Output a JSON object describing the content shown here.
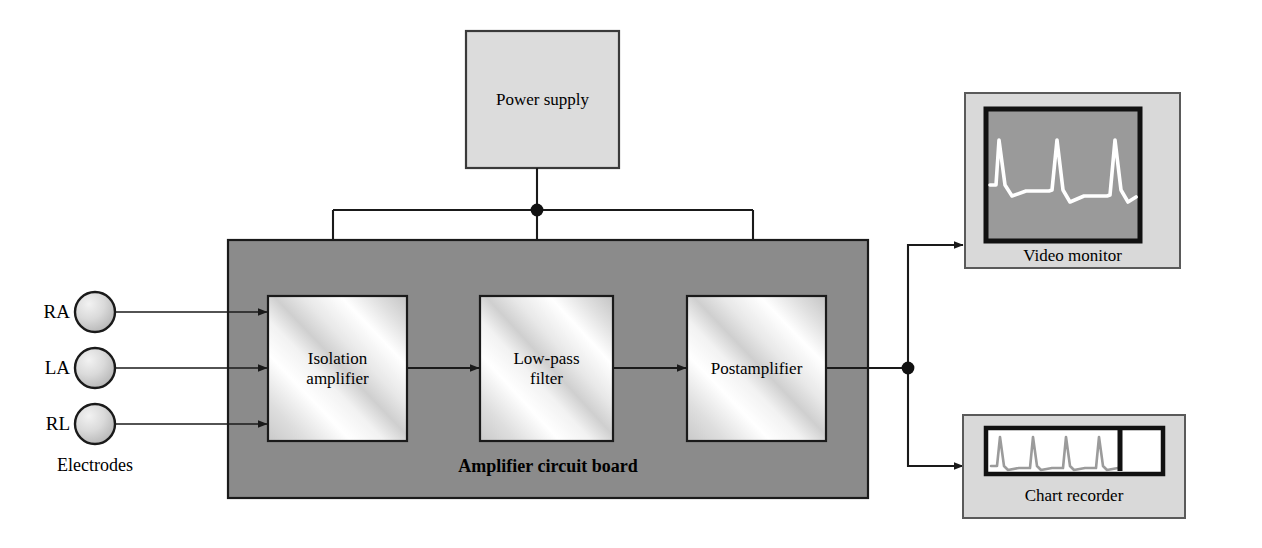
{
  "diagram": {
    "colors": {
      "board_fill": "#8b8b8b",
      "board_stroke": "#1a1a1a",
      "block_light": "#ffffff",
      "block_mid": "#d8d8d8",
      "block_stroke": "#1a1a1a",
      "device_fill": "#d9d9d9",
      "device_stroke": "#4d4d4d",
      "screen_fill": "#9a9a9a",
      "screen_stroke": "#111111",
      "paper_fill": "#ffffff",
      "trace_video": "#ffffff",
      "trace_chart": "#9b9b9b",
      "line": "#1a1a1a",
      "power_fill": "#dcdcdc"
    }
  },
  "power_supply": {
    "label": "Power supply"
  },
  "board": {
    "label": "Amplifier circuit board",
    "blocks": [
      {
        "id": "isolation-amplifier",
        "line1": "Isolation",
        "line2": "amplifier"
      },
      {
        "id": "low-pass-filter",
        "line1": "Low-pass",
        "line2": "filter"
      },
      {
        "id": "postamplifier",
        "line1": "Postamplifier",
        "line2": ""
      }
    ]
  },
  "electrodes": {
    "caption": "Electrodes",
    "items": [
      {
        "id": "ra",
        "label": "RA"
      },
      {
        "id": "la",
        "label": "LA"
      },
      {
        "id": "rl",
        "label": "RL"
      }
    ]
  },
  "outputs": {
    "video_monitor": {
      "label": "Video monitor",
      "waveform": "ecg-trace-3-beats"
    },
    "chart_recorder": {
      "label": "Chart recorder",
      "waveform": "ecg-trace-4-beats"
    }
  },
  "connections": {
    "power_bus_label": "power-distribution-bus",
    "junction_count": 2
  }
}
